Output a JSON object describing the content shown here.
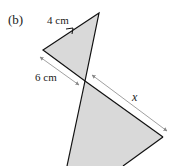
{
  "part_label": "(b)",
  "labels": {
    "top_edge": "4 cm",
    "left_segment": "6 cm",
    "right_segment": "x"
  },
  "colors": {
    "fill": "#d9d9d9",
    "stroke": "#111111",
    "arrow": "#888888"
  }
}
